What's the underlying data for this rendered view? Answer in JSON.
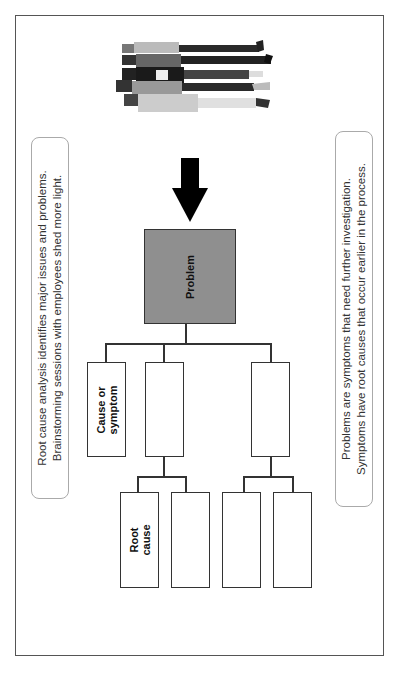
{
  "diagram": {
    "problem_label": "Problem",
    "mid_nodes": [
      {
        "label_line1": "Cause or",
        "label_line2": "symptom"
      },
      {
        "label_line1": "",
        "label_line2": ""
      },
      {
        "label_line1": "",
        "label_line2": ""
      }
    ],
    "leaf_nodes": [
      {
        "label_line1": "Root",
        "label_line2": "cause"
      },
      {
        "label_line1": "",
        "label_line2": ""
      },
      {
        "label_line1": "",
        "label_line2": ""
      },
      {
        "label_line1": "",
        "label_line2": ""
      }
    ],
    "arrow_icon": "down-arrow-icon",
    "image": "group-of-employees-illustration",
    "orientation": "rotated-90-ccw"
  },
  "callouts": {
    "left": {
      "line1": "Root cause analysis identifies major issues and problems.",
      "line2": "Brainstorming sessions with employees shed more light."
    },
    "right": {
      "line1": "Problems are symptoms that need further investigation.",
      "line2": "Symptoms have root causes that occur earlier in the process."
    }
  },
  "colors": {
    "problem_fill": "#8f8f8f",
    "line": "#333333",
    "frame": "#555555"
  }
}
